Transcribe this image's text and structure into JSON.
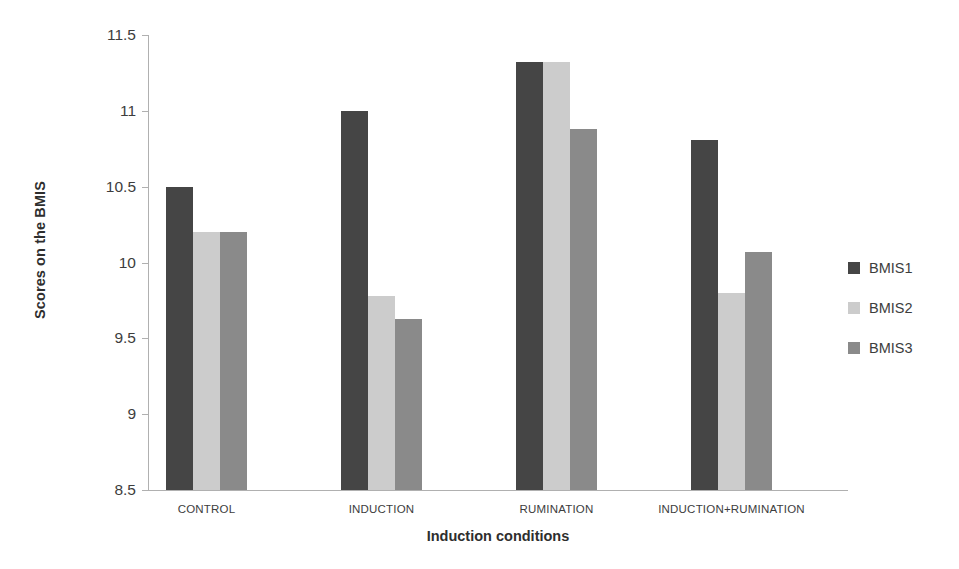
{
  "chart_data": {
    "type": "bar",
    "title": "",
    "subtitle": "",
    "xlabel": "Induction conditions",
    "ylabel": "Scores on the BMIS",
    "categories": [
      "CONTROL",
      "INDUCTION",
      "RUMINATION",
      "INDUCTION+RUMINATION"
    ],
    "series": [
      {
        "name": "BMIS1",
        "color": "#454545",
        "values": [
          10.5,
          11.0,
          11.32,
          10.81
        ]
      },
      {
        "name": "BMIS2",
        "color": "#cccccc",
        "values": [
          10.2,
          9.78,
          11.32,
          9.8
        ]
      },
      {
        "name": "BMIS3",
        "color": "#8a8a8a",
        "values": [
          10.2,
          9.63,
          10.88,
          10.07
        ]
      }
    ],
    "ylim": [
      8.5,
      11.5
    ],
    "yticks": [
      8.5,
      9,
      9.5,
      10,
      10.5,
      11,
      11.5
    ],
    "ytick_labels": [
      "8.5",
      "9",
      "9.5",
      "10",
      "10.5",
      "11",
      "11.5"
    ],
    "grid": false,
    "legend_position": "right",
    "axis_color": "#b0b0b0",
    "background": "#ffffff"
  }
}
